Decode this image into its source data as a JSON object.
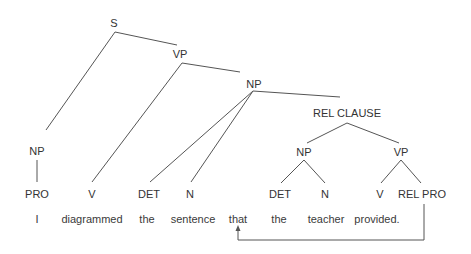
{
  "diagram": {
    "type": "syntax-tree",
    "nodes": {
      "s": "S",
      "vp_main": "VP",
      "np_object": "NP",
      "rel_clause": "REL CLAUSE",
      "np_subject": "NP",
      "np_rel": "NP",
      "vp_rel": "VP"
    },
    "pos_tags": [
      {
        "label": "PRO"
      },
      {
        "label": "V"
      },
      {
        "label": "DET"
      },
      {
        "label": "N"
      },
      {
        "label": "DET"
      },
      {
        "label": "N"
      },
      {
        "label": "V"
      },
      {
        "label": "REL PRO"
      }
    ],
    "words": [
      {
        "text": "I"
      },
      {
        "text": "diagrammed"
      },
      {
        "text": "the"
      },
      {
        "text": "sentence"
      },
      {
        "text": "that"
      },
      {
        "text": "the"
      },
      {
        "text": "teacher"
      },
      {
        "text": "provided."
      }
    ],
    "arrow": {
      "from": "REL PRO",
      "to": "that"
    },
    "colors": {
      "line": "#555555",
      "text": "#333333",
      "background": "#ffffff"
    }
  }
}
